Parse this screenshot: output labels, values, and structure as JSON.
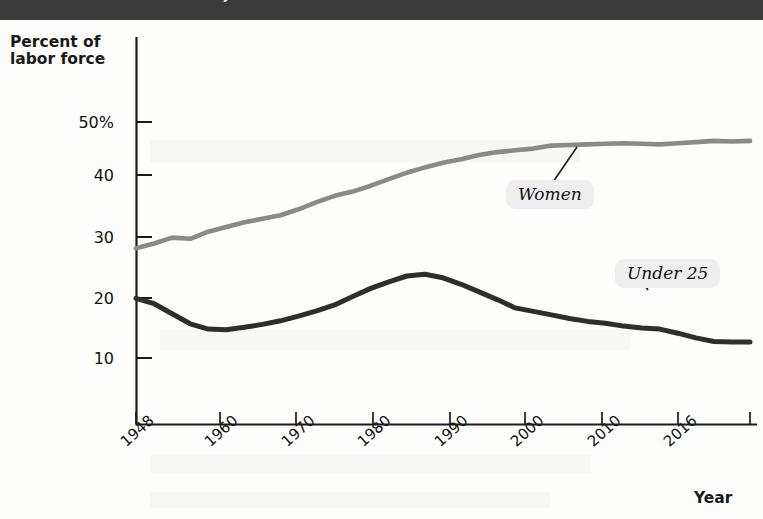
{
  "title": {
    "text": "he U.S. Labor Force, 1948–2016",
    "band_color": "#3b3b3b",
    "text_color": "#ffffff"
  },
  "axes": {
    "ylabel_line1": "Percent of",
    "ylabel_line2": "labor force",
    "xlabel": "Year",
    "yticks": [
      "50%",
      "40",
      "30",
      "20",
      "10"
    ],
    "xticks": [
      "1948",
      "1960",
      "1970",
      "1980",
      "1990",
      "2000",
      "2010",
      "2016"
    ]
  },
  "callouts": {
    "women": "Women",
    "under25": "Under 25"
  },
  "colors": {
    "women_line": "#8a8a8a",
    "under25_line": "#2e2e2e",
    "axis": "#1a1a1a",
    "callout_bg": "#eeeeee"
  },
  "chart_data": {
    "type": "line",
    "title": "he U.S. Labor Force, 1948–2016",
    "xlabel": "Year",
    "ylabel": "Percent of labor force",
    "xlim": [
      1948,
      2016
    ],
    "ylim": [
      0,
      55
    ],
    "yticks": [
      10,
      20,
      30,
      40,
      50
    ],
    "xticks": [
      1948,
      1960,
      1970,
      1980,
      1990,
      2000,
      2010,
      2016
    ],
    "grid": false,
    "legend": "inline-callouts",
    "x": [
      1948,
      1950,
      1952,
      1954,
      1956,
      1958,
      1960,
      1962,
      1964,
      1966,
      1968,
      1970,
      1972,
      1974,
      1976,
      1978,
      1980,
      1982,
      1984,
      1986,
      1988,
      1990,
      1992,
      1994,
      1996,
      1998,
      2000,
      2002,
      2004,
      2006,
      2008,
      2010,
      2012,
      2014,
      2016
    ],
    "series": [
      {
        "name": "Women",
        "color": "#8a8a8a",
        "values": [
          28.6,
          29.4,
          30.4,
          30.2,
          31.4,
          32.2,
          33.0,
          33.6,
          34.2,
          35.2,
          36.4,
          37.5,
          38.2,
          39.2,
          40.3,
          41.4,
          42.3,
          43.1,
          43.7,
          44.4,
          44.9,
          45.2,
          45.5,
          46.0,
          46.1,
          46.2,
          46.3,
          46.4,
          46.3,
          46.2,
          46.4,
          46.6,
          46.8,
          46.7,
          46.8
        ]
      },
      {
        "name": "Under 25",
        "color": "#2e2e2e",
        "values": [
          20.1,
          19.2,
          17.5,
          15.8,
          14.9,
          14.8,
          15.2,
          15.7,
          16.3,
          17.1,
          18.0,
          19.0,
          20.4,
          21.8,
          22.9,
          23.9,
          24.2,
          23.6,
          22.5,
          21.2,
          19.9,
          18.5,
          17.9,
          17.3,
          16.7,
          16.2,
          15.9,
          15.4,
          15.1,
          14.9,
          14.2,
          13.4,
          12.8,
          12.7,
          12.7
        ]
      }
    ],
    "annotations": [
      {
        "label": "Women",
        "series": "Women",
        "at_x": 1992,
        "at_y": 44.6
      },
      {
        "label": "Under 25",
        "series": "Under 25",
        "at_x": 2003,
        "at_y": 15.2
      }
    ]
  }
}
